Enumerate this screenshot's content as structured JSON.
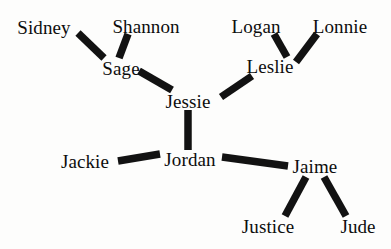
{
  "diagram": {
    "type": "social-network-graph",
    "background_color": "#fdfdfc",
    "edge_color": "#121212",
    "label_color": "#0d0d0d",
    "width": 391,
    "height": 249,
    "nodes": [
      {
        "id": "sidney",
        "label": "Sidney",
        "x": 44,
        "y": 27
      },
      {
        "id": "shannon",
        "label": "Shannon",
        "x": 146,
        "y": 26
      },
      {
        "id": "logan",
        "label": "Logan",
        "x": 256,
        "y": 26
      },
      {
        "id": "lonnie",
        "label": "Lonnie",
        "x": 340,
        "y": 26
      },
      {
        "id": "sage",
        "label": "Sage",
        "x": 121,
        "y": 68
      },
      {
        "id": "leslie",
        "label": "Leslie",
        "x": 270,
        "y": 66
      },
      {
        "id": "jessie",
        "label": "Jessie",
        "x": 188,
        "y": 101
      },
      {
        "id": "jordan",
        "label": "Jordan",
        "x": 190,
        "y": 159
      },
      {
        "id": "jackie",
        "label": "Jackie",
        "x": 85,
        "y": 161
      },
      {
        "id": "jaime",
        "label": "Jaime",
        "x": 315,
        "y": 166
      },
      {
        "id": "justice",
        "label": "Justice",
        "x": 268,
        "y": 226
      },
      {
        "id": "jude",
        "label": "Jude",
        "x": 358,
        "y": 226
      }
    ],
    "edges": [
      {
        "source": "sidney",
        "target": "sage",
        "x1": 78,
        "y1": 33,
        "x2": 104,
        "y2": 58
      },
      {
        "source": "shannon",
        "target": "sage",
        "x1": 128,
        "y1": 34,
        "x2": 119,
        "y2": 58
      },
      {
        "source": "sage",
        "target": "jessie",
        "x1": 139,
        "y1": 71,
        "x2": 172,
        "y2": 90
      },
      {
        "source": "logan",
        "target": "leslie",
        "x1": 274,
        "y1": 34,
        "x2": 287,
        "y2": 57
      },
      {
        "source": "lonnie",
        "target": "leslie",
        "x1": 317,
        "y1": 34,
        "x2": 296,
        "y2": 62
      },
      {
        "source": "leslie",
        "target": "jessie",
        "x1": 252,
        "y1": 76,
        "x2": 221,
        "y2": 97
      },
      {
        "source": "jessie",
        "target": "jordan",
        "x1": 188,
        "y1": 110,
        "x2": 188,
        "y2": 150
      },
      {
        "source": "jackie",
        "target": "jordan",
        "x1": 118,
        "y1": 161,
        "x2": 160,
        "y2": 154
      },
      {
        "source": "jordan",
        "target": "jaime",
        "x1": 222,
        "y1": 157,
        "x2": 288,
        "y2": 166
      },
      {
        "source": "jaime",
        "target": "justice",
        "x1": 306,
        "y1": 177,
        "x2": 285,
        "y2": 216
      },
      {
        "source": "jaime",
        "target": "jude",
        "x1": 324,
        "y1": 177,
        "x2": 346,
        "y2": 216
      }
    ]
  }
}
